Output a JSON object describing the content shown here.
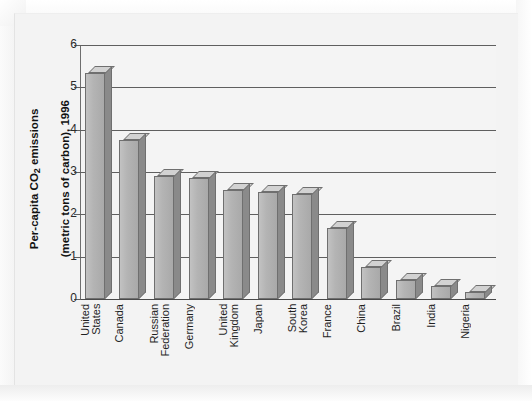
{
  "chart_data": {
    "type": "bar",
    "title": "",
    "xlabel": "",
    "ylabel": "Per-capita CO2 emissions (metric tons of carbon), 1996",
    "ylabel_line1": "Per-capita CO2 emissions",
    "ylabel_line2": "(metric tons of carbon), 1996",
    "categories": [
      "United\nStates",
      "Canada",
      "Russian\nFederation",
      "Germany",
      "United\nKingdom",
      "Japan",
      "South\nKorea",
      "France",
      "China",
      "Brazil",
      "India",
      "Nigeria"
    ],
    "values": [
      5.35,
      3.75,
      2.9,
      2.87,
      2.58,
      2.52,
      2.47,
      1.68,
      0.75,
      0.45,
      0.3,
      0.17
    ],
    "ylim": [
      0,
      6
    ],
    "ytick_labels": [
      "0",
      "1",
      "2",
      "3",
      "4",
      "5",
      "6"
    ],
    "ytick_values": [
      0,
      1,
      2,
      3,
      4,
      5,
      6
    ],
    "grid": true,
    "legend": false,
    "bar_face_color": "#b4b4b4",
    "bar_side_color": "#8a8a8a",
    "bar_top_color": "#d2d2d2",
    "bar_outline_color": "#6f6f6f",
    "gridline_color": "#5f5f5f",
    "plot_background": "#f4f4f4",
    "panel_background": "#f3f3f3"
  }
}
